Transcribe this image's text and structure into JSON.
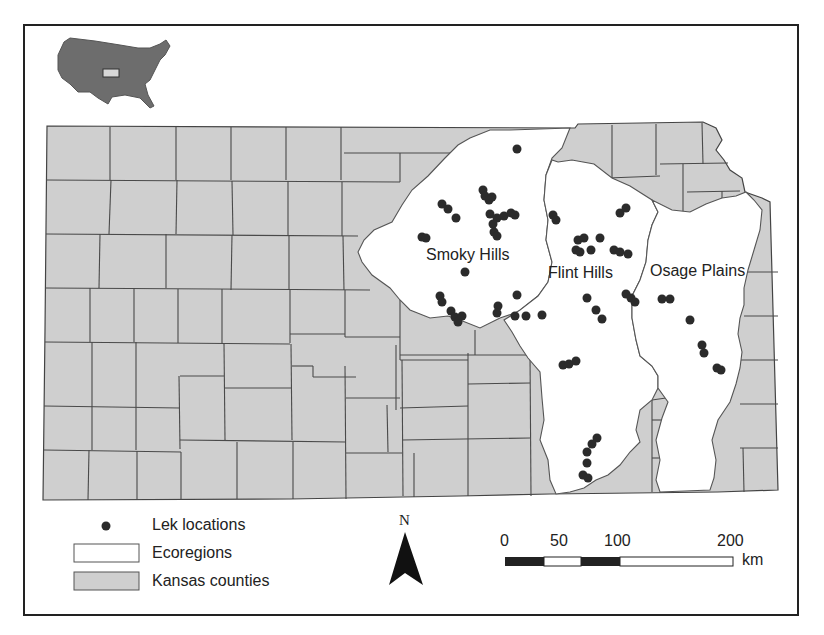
{
  "map": {
    "title": "",
    "inset": {
      "name": "usa-inset-map",
      "highlight": "Kansas"
    },
    "regions": [
      {
        "name": "Smoky Hills",
        "x": 428,
        "y": 247
      },
      {
        "name": "Flint Hills",
        "x": 548,
        "y": 264
      },
      {
        "name": "Osage Plains",
        "x": 650,
        "y": 262
      }
    ],
    "colors": {
      "county_fill": "#cfcfcf",
      "ecoregion_fill": "#ffffff",
      "lek": "#2b2b2b",
      "border": "#4a4a4a"
    }
  },
  "legend": {
    "items": [
      {
        "label": "Lek locations",
        "symbol": "dot"
      },
      {
        "label": "Ecoregions",
        "symbol": "white-box"
      },
      {
        "label": "Kansas counties",
        "symbol": "gray-box"
      }
    ]
  },
  "north_arrow": {
    "label": "N"
  },
  "scale_bar": {
    "ticks": [
      "0",
      "50",
      "100",
      "200"
    ],
    "unit": "km"
  }
}
